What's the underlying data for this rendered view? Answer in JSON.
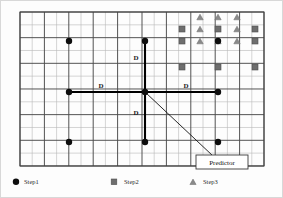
{
  "figure": {
    "title": "",
    "annotations": {
      "distance_label": "D",
      "predictor_label": "Predictor"
    },
    "colors": {
      "step1": "#0d0d0d",
      "step2": "#6e6e6e",
      "step3": "#8a8a8a",
      "grid_minor": "#b9b9b9",
      "grid_major": "#4a4a4a",
      "cross": "#000000",
      "background": "#fdfdfd",
      "frame": "#c8c8c8"
    },
    "d_labels": [
      {
        "name": "d-up",
        "text": "D",
        "x": 136,
        "y": 60
      },
      {
        "name": "d-left",
        "text": "D",
        "x": 101,
        "y": 88
      },
      {
        "name": "d-right",
        "text": "D",
        "x": 186,
        "y": 88
      },
      {
        "name": "d-down",
        "text": "D",
        "x": 136,
        "y": 115
      }
    ],
    "grid": {
      "x0": 20,
      "y0": 12,
      "x1": 264,
      "y1": 166,
      "cell_w": 12.2,
      "cell_h": 12.83,
      "cols": 20,
      "rows": 12,
      "major_every": 2
    },
    "center": {
      "x": 145,
      "y": 92,
      "name": "cross-center"
    },
    "cross_arms": [
      {
        "name": "cross-arm-up",
        "x2": 145,
        "y2": 41
      },
      {
        "name": "cross-arm-down",
        "x2": 145,
        "y2": 142
      },
      {
        "name": "cross-arm-left",
        "x2": 69,
        "y2": 92
      },
      {
        "name": "cross-arm-right",
        "x2": 218,
        "y2": 92
      }
    ],
    "predictor": {
      "box": {
        "x": 196,
        "y": 155,
        "w": 52,
        "h": 14
      },
      "line_from": {
        "x": 145,
        "y": 92
      },
      "line_to": {
        "x": 213,
        "y": 156
      }
    },
    "markers": {
      "step1": [
        {
          "x": 69,
          "y": 41
        },
        {
          "x": 145,
          "y": 41
        },
        {
          "x": 69,
          "y": 92
        },
        {
          "x": 145,
          "y": 92
        },
        {
          "x": 218,
          "y": 92
        },
        {
          "x": 69,
          "y": 142
        },
        {
          "x": 145,
          "y": 142
        },
        {
          "x": 218,
          "y": 142
        },
        {
          "x": 218,
          "y": 41
        }
      ],
      "step2": [
        {
          "x": 182,
          "y": 29
        },
        {
          "x": 218,
          "y": 29
        },
        {
          "x": 255,
          "y": 29
        },
        {
          "x": 182,
          "y": 41
        },
        {
          "x": 255,
          "y": 41
        },
        {
          "x": 182,
          "y": 67
        },
        {
          "x": 218,
          "y": 67
        },
        {
          "x": 255,
          "y": 67
        }
      ],
      "step3": [
        {
          "x": 200,
          "y": 17
        },
        {
          "x": 218,
          "y": 17
        },
        {
          "x": 237,
          "y": 17
        },
        {
          "x": 200,
          "y": 29
        },
        {
          "x": 237,
          "y": 29
        },
        {
          "x": 200,
          "y": 41
        },
        {
          "x": 218,
          "y": 41
        },
        {
          "x": 237,
          "y": 41
        }
      ]
    }
  },
  "legend": {
    "items": [
      {
        "name": "legend-step1",
        "marker": "circle-icon",
        "label": "Step1",
        "x": 24,
        "mx": 16,
        "color": "#0d0d0d"
      },
      {
        "name": "legend-step2",
        "marker": "square-icon",
        "label": "Step2",
        "x": 124,
        "mx": 114,
        "color": "#6e6e6e"
      },
      {
        "name": "legend-step3",
        "marker": "triangle-icon",
        "label": "Step3",
        "x": 203,
        "mx": 193,
        "color": "#8a8a8a"
      }
    ],
    "y": 184
  }
}
